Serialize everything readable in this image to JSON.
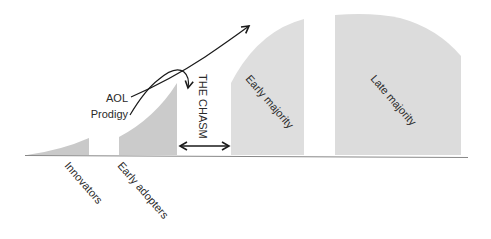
{
  "diagram": {
    "segments": [
      {
        "id": "innovators",
        "label": "Innovators",
        "fill": "#c9c9c9"
      },
      {
        "id": "early-adopters",
        "label": "Early adopters",
        "fill": "#cbcbcb"
      },
      {
        "id": "early-majority",
        "label": "Early majority",
        "fill": "#dedede"
      },
      {
        "id": "late-majority",
        "label": "Late majority",
        "fill": "#dcdcdc"
      }
    ],
    "chasm": {
      "label": "THE CHASM"
    },
    "annotations": {
      "aol": "AOL",
      "prodigy": "Prodigy"
    },
    "colors": {
      "line": "#1a1a1a",
      "baseline": "#888888",
      "text": "#2a2a2a"
    }
  }
}
